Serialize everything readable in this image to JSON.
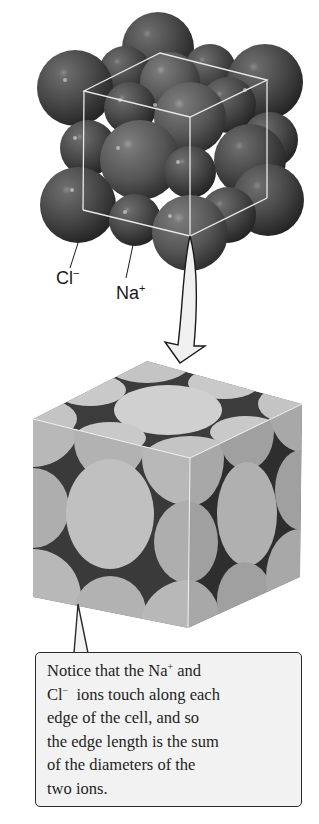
{
  "figure": {
    "top_model": {
      "description": "Space-filling model of NaCl lattice with unit cell wireframe",
      "labels": [
        {
          "id": "chloride",
          "base": "Cl",
          "charge": "−"
        },
        {
          "id": "sodium",
          "base": "Na",
          "charge": "+"
        }
      ],
      "sphere_color": "#4a4a4a",
      "wireframe_color": "#e8e8e8"
    },
    "arrow": {
      "direction": "down",
      "fill": "#f0f0f0",
      "stroke": "#1a1a1a"
    },
    "bottom_model": {
      "description": "Unit cell cut-away showing ion cross-sections on cube faces",
      "face_colors": {
        "top": "#c8c8c8",
        "front": "#b4b4b4",
        "side": "#a6a6a6",
        "gap": "#3a3a3a"
      }
    },
    "callout": {
      "lines": [
        {
          "parts": [
            {
              "t": "Notice that the Na"
            },
            {
              "sup": "+"
            },
            {
              "t": " and"
            }
          ]
        },
        {
          "parts": [
            {
              "t": "Cl"
            },
            {
              "sup": "−"
            },
            {
              "t": "  ions touch along each"
            }
          ]
        },
        {
          "parts": [
            {
              "t": "edge of the cell, and so"
            }
          ]
        },
        {
          "parts": [
            {
              "t": "the edge length is the sum"
            }
          ]
        },
        {
          "parts": [
            {
              "t": "of the diameters of the"
            }
          ]
        },
        {
          "parts": [
            {
              "t": "two ions."
            }
          ]
        }
      ],
      "background": "#f2f2f2",
      "border": "#2a2a2a"
    }
  }
}
